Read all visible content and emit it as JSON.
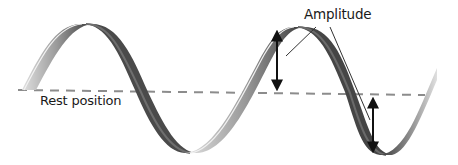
{
  "diagram": {
    "type": "transverse-wave",
    "labels": {
      "amplitude": "Amplitude",
      "rest_position": "Rest position"
    },
    "colors": {
      "background": "#ffffff",
      "ribbon_light": "#d8d8d8",
      "ribbon_mid": "#8a8a8a",
      "ribbon_dark": "#3a3a3a",
      "rest_line": "#8c8c8c",
      "arrow": "#111111",
      "leader_line": "#333333",
      "text": "#1a1a1a"
    },
    "elements": {
      "wave": "sinusoidal ribbon, ~1.75 wavelengths, starts at rest position on left, ends rising on right",
      "rest_line": "dashed horizontal line",
      "amplitude_arrows": [
        {
          "position": "crest",
          "from": "rest line",
          "to": "crest top"
        },
        {
          "position": "trough",
          "from": "rest line",
          "to": "trough bottom"
        }
      ],
      "leader_lines": 2
    }
  }
}
